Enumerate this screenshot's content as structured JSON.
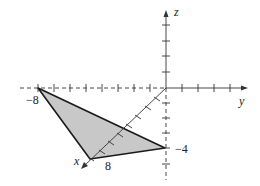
{
  "figure": {
    "type": "3d-coordinate-diagram",
    "axes": {
      "x": {
        "label": "x"
      },
      "y": {
        "label": "y"
      },
      "z": {
        "label": "z"
      }
    },
    "tick_labels": {
      "y_neg8": "−8",
      "x_8": "8",
      "z_neg4": "−4"
    },
    "triangle": {
      "vertices": [
        {
          "name": "A",
          "coords": [
            0,
            -8,
            0
          ]
        },
        {
          "name": "B",
          "coords": [
            8,
            0,
            0
          ]
        },
        {
          "name": "C",
          "coords": [
            0,
            0,
            -4
          ]
        }
      ],
      "fill_color": "#c8c8c8",
      "edge_color": "#1a1a1a"
    },
    "colors": {
      "axis": "#333333",
      "background": "#ffffff"
    }
  }
}
